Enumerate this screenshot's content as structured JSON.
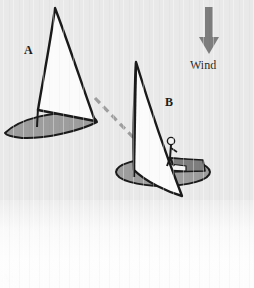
{
  "figure": {
    "background_color": "#e9e9e9",
    "caption_text": "re A:",
    "wind_label": "Wind",
    "boat_a_label": "A",
    "boat_b_label": "B",
    "colors": {
      "sail_fill": "#fbfbfb",
      "sail_outline": "#1a1a1a",
      "hull_fill": "#9a9a9a",
      "hull_outline": "#1a1a1a",
      "arrow": "#7d7d7d",
      "dashed_line": "#9e9e9e",
      "text": "#1d1d1d"
    },
    "wind_arrow": {
      "direction": "down",
      "shaft_x": 209,
      "shaft_top_y": 8,
      "shaft_bottom_y": 38,
      "head_tip_y": 53
    },
    "boat_a": {
      "sail_apex": [
        55,
        8
      ],
      "mast_base": [
        38,
        111
      ],
      "boom_end": [
        96,
        122
      ],
      "hull_bow": [
        5,
        134
      ],
      "hull_stern": [
        96,
        122
      ]
    },
    "boat_b": {
      "mast_top": [
        136,
        62
      ],
      "mast_base": [
        135,
        171
      ],
      "sail_tip": [
        182,
        196
      ],
      "hull_center": [
        163,
        172
      ],
      "sailor_position": [
        171,
        148
      ]
    },
    "dashed_line": {
      "from": [
        96,
        99
      ],
      "to": [
        155,
        160
      ],
      "dash_pattern": "7 5",
      "width": 3
    }
  }
}
